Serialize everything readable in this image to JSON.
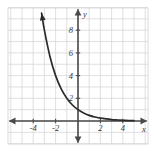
{
  "chart_data": {
    "type": "line",
    "title": "",
    "xlabel": "x",
    "ylabel": "y",
    "xlim": [
      -5.5,
      5.5
    ],
    "ylim": [
      -1.2,
      9.6
    ],
    "grid": true,
    "grid_step": 1,
    "legend": "none",
    "x_ticks": [
      "-4",
      "-2",
      "2",
      "4"
    ],
    "x_tick_values": [
      -4,
      -2,
      2,
      4
    ],
    "y_ticks": [
      "2",
      "4",
      "6",
      "8"
    ],
    "y_tick_values": [
      2,
      4,
      6,
      8
    ],
    "series": [
      {
        "name": "exponential-decay-curve",
        "equation": "y = 2^(-x)",
        "arrow_start": true,
        "arrow_end": false,
        "points": [
          {
            "x": -3.25,
            "y": 9.5
          },
          {
            "x": -3.0,
            "y": 8.0
          },
          {
            "x": -2.5,
            "y": 5.66
          },
          {
            "x": -2.0,
            "y": 4.0
          },
          {
            "x": -1.5,
            "y": 2.83
          },
          {
            "x": -1.0,
            "y": 2.0
          },
          {
            "x": -0.5,
            "y": 1.41
          },
          {
            "x": 0.0,
            "y": 1.0
          },
          {
            "x": 0.5,
            "y": 0.71
          },
          {
            "x": 1.0,
            "y": 0.5
          },
          {
            "x": 1.5,
            "y": 0.35
          },
          {
            "x": 2.0,
            "y": 0.25
          },
          {
            "x": 2.5,
            "y": 0.18
          },
          {
            "x": 3.0,
            "y": 0.125
          },
          {
            "x": 3.5,
            "y": 0.09
          },
          {
            "x": 4.0,
            "y": 0.0625
          },
          {
            "x": 4.5,
            "y": 0.04
          },
          {
            "x": 5.0,
            "y": 0.03
          }
        ]
      }
    ]
  },
  "colors": {
    "background": "#ffffff",
    "grid_line": "#d8d6da",
    "axis_line": "#4a4a4a",
    "curve": "#2b2b2b",
    "tick_text": "#3a3a3a"
  },
  "axes": {
    "x_axis_label": "x",
    "y_axis_label": "y"
  }
}
